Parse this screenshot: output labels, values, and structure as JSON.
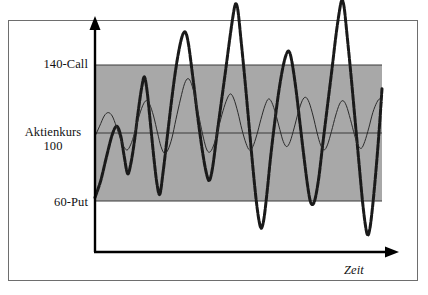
{
  "figure": {
    "background": "#ffffff",
    "frame_color": "#6e6e6e",
    "band_fill": "#a8a8a8",
    "axis_color": "#000000",
    "curve_bold_color": "#1a1a1a",
    "curve_thin_color": "#2b2b2b"
  },
  "labels": {
    "upper_barrier": "140-Call",
    "reference_name": "Aktienkurs",
    "reference_value": "100",
    "lower_barrier": "60-Put",
    "x_axis": "Zeit"
  },
  "chart_data": {
    "type": "line",
    "title": "",
    "xlabel": "Zeit",
    "ylabel": "",
    "grid": false,
    "legend": "none",
    "ylim": [
      0,
      180
    ],
    "xlim": [
      0,
      100
    ],
    "axis_ticks": {
      "y_labeled": [
        {
          "value": 140,
          "label": "140-Call"
        },
        {
          "value": 100,
          "label": "Aktienkurs 100"
        },
        {
          "value": 60,
          "label": "60-Put"
        }
      ],
      "x_labeled": []
    },
    "annotations": [
      {
        "type": "band",
        "name": "corridor-140-60",
        "y_from": 60,
        "y_to": 140,
        "fill": "#a8a8a8"
      },
      {
        "type": "hline",
        "name": "upper-barrier-140",
        "y": 140
      },
      {
        "type": "hline",
        "name": "reference-line-100",
        "y": 100
      },
      {
        "type": "hline",
        "name": "lower-barrier-60",
        "y": 60
      }
    ],
    "series": [
      {
        "name": "volatile-underlying-bold",
        "style": "bold-dashed",
        "color": "#1a1a1a",
        "points": [
          [
            0.0,
            62
          ],
          [
            2.0,
            72
          ],
          [
            4.0,
            86
          ],
          [
            6.0,
            99
          ],
          [
            7.6,
            104
          ],
          [
            9.0,
            98
          ],
          [
            10.2,
            86
          ],
          [
            11.4,
            76
          ],
          [
            12.6,
            83
          ],
          [
            13.8,
            96
          ],
          [
            15.0,
            112
          ],
          [
            16.2,
            126
          ],
          [
            17.2,
            133
          ],
          [
            18.2,
            124
          ],
          [
            19.4,
            104
          ],
          [
            20.6,
            84
          ],
          [
            21.6,
            70
          ],
          [
            22.6,
            64
          ],
          [
            23.8,
            78
          ],
          [
            25.2,
            98
          ],
          [
            26.6,
            118
          ],
          [
            28.0,
            136
          ],
          [
            29.4,
            150
          ],
          [
            30.6,
            158
          ],
          [
            31.6,
            159
          ],
          [
            32.6,
            152
          ],
          [
            34.0,
            134
          ],
          [
            35.6,
            112
          ],
          [
            37.2,
            92
          ],
          [
            38.6,
            78
          ],
          [
            39.8,
            72
          ],
          [
            41.0,
            80
          ],
          [
            42.4,
            98
          ],
          [
            44.0,
            118
          ],
          [
            45.6,
            138
          ],
          [
            47.0,
            156
          ],
          [
            48.2,
            170
          ],
          [
            49.0,
            176
          ],
          [
            49.8,
            172
          ],
          [
            50.8,
            156
          ],
          [
            52.2,
            132
          ],
          [
            53.6,
            106
          ],
          [
            55.0,
            80
          ],
          [
            56.2,
            60
          ],
          [
            57.2,
            48
          ],
          [
            58.0,
            44
          ],
          [
            58.9,
            50
          ],
          [
            60.0,
            66
          ],
          [
            61.2,
            86
          ],
          [
            62.6,
            106
          ],
          [
            64.0,
            124
          ],
          [
            65.4,
            138
          ],
          [
            66.6,
            146
          ],
          [
            67.6,
            148
          ],
          [
            68.6,
            142
          ],
          [
            70.0,
            126
          ],
          [
            71.4,
            106
          ],
          [
            72.8,
            86
          ],
          [
            74.0,
            70
          ],
          [
            75.0,
            60
          ],
          [
            75.9,
            58
          ],
          [
            76.8,
            62
          ],
          [
            78.0,
            74
          ],
          [
            79.4,
            94
          ],
          [
            81.0,
            116
          ],
          [
            82.6,
            138
          ],
          [
            84.0,
            158
          ],
          [
            85.2,
            172
          ],
          [
            86.0,
            178
          ],
          [
            86.8,
            174
          ],
          [
            87.8,
            158
          ],
          [
            89.2,
            134
          ],
          [
            90.6,
            108
          ],
          [
            92.0,
            82
          ],
          [
            93.2,
            60
          ],
          [
            94.2,
            46
          ],
          [
            95.0,
            40
          ],
          [
            95.8,
            44
          ],
          [
            96.8,
            58
          ],
          [
            98.0,
            80
          ],
          [
            99.2,
            106
          ],
          [
            100.0,
            126
          ]
        ]
      },
      {
        "name": "low-volatility-underlying-thin",
        "style": "thin-solid",
        "color": "#2b2b2b",
        "points": [
          [
            0.0,
            98
          ],
          [
            1.6,
            104
          ],
          [
            3.2,
            110
          ],
          [
            4.6,
            112
          ],
          [
            6.0,
            110
          ],
          [
            7.4,
            104
          ],
          [
            8.8,
            97
          ],
          [
            10.0,
            92
          ],
          [
            11.2,
            90
          ],
          [
            12.4,
            93
          ],
          [
            13.8,
            100
          ],
          [
            15.2,
            109
          ],
          [
            16.6,
            116
          ],
          [
            17.8,
            119
          ],
          [
            19.0,
            117
          ],
          [
            20.4,
            110
          ],
          [
            21.8,
            100
          ],
          [
            23.0,
            92
          ],
          [
            24.2,
            88
          ],
          [
            25.4,
            90
          ],
          [
            26.8,
            97
          ],
          [
            28.2,
            108
          ],
          [
            29.8,
            120
          ],
          [
            31.2,
            129
          ],
          [
            32.4,
            132
          ],
          [
            33.6,
            129
          ],
          [
            35.0,
            120
          ],
          [
            36.4,
            108
          ],
          [
            37.8,
            97
          ],
          [
            39.0,
            90
          ],
          [
            40.2,
            89
          ],
          [
            41.6,
            94
          ],
          [
            43.0,
            103
          ],
          [
            44.6,
            113
          ],
          [
            46.0,
            120
          ],
          [
            47.2,
            123
          ],
          [
            48.4,
            120
          ],
          [
            49.8,
            112
          ],
          [
            51.2,
            102
          ],
          [
            52.6,
            94
          ],
          [
            53.8,
            90
          ],
          [
            55.0,
            92
          ],
          [
            56.4,
            99
          ],
          [
            57.8,
            108
          ],
          [
            59.2,
            116
          ],
          [
            60.4,
            120
          ],
          [
            61.6,
            118
          ],
          [
            63.0,
            111
          ],
          [
            64.4,
            102
          ],
          [
            65.6,
            95
          ],
          [
            66.8,
            92
          ],
          [
            68.0,
            95
          ],
          [
            69.4,
            103
          ],
          [
            70.8,
            112
          ],
          [
            72.2,
            119
          ],
          [
            73.4,
            121
          ],
          [
            74.6,
            118
          ],
          [
            76.0,
            110
          ],
          [
            77.4,
            100
          ],
          [
            78.6,
            93
          ],
          [
            79.8,
            90
          ],
          [
            81.0,
            93
          ],
          [
            82.4,
            101
          ],
          [
            83.8,
            110
          ],
          [
            85.2,
            117
          ],
          [
            86.4,
            119
          ],
          [
            87.6,
            116
          ],
          [
            89.0,
            108
          ],
          [
            90.4,
            99
          ],
          [
            91.6,
            93
          ],
          [
            92.8,
            91
          ],
          [
            94.0,
            95
          ],
          [
            95.4,
            103
          ],
          [
            96.8,
            112
          ],
          [
            98.2,
            118
          ],
          [
            99.2,
            120
          ],
          [
            100.0,
            118
          ]
        ]
      }
    ]
  },
  "geometry": {
    "plot_left_px": 95,
    "plot_right_px": 382,
    "y_axis_top_px": 18,
    "x_axis_y_px": 252,
    "band_top_px": 65,
    "band_bottom_px": 201,
    "ref_line_px": 133
  }
}
